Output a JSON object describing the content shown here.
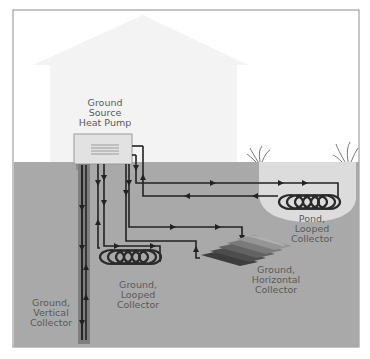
{
  "diagram": {
    "colors": {
      "frame": "#8c8c8c",
      "sky": "#ffffff",
      "house": "#f3f3f3",
      "ground": "#a9a9a9",
      "pond": "#dcdcdc",
      "pipe": "#2a2a2a",
      "unit": "#e2e2e2",
      "label_text": "#5a5a5a"
    },
    "labels": {
      "heat_pump": [
        "Ground",
        "Source",
        "Heat Pump"
      ],
      "vertical": [
        "Ground,",
        "Vertical",
        "Collector"
      ],
      "looped": [
        "Ground,",
        "Looped",
        "Collector"
      ],
      "horizontal": [
        "Ground,",
        "Horizontal",
        "Collector"
      ],
      "pond": [
        "Pond,",
        "Looped",
        "Collector"
      ]
    }
  }
}
